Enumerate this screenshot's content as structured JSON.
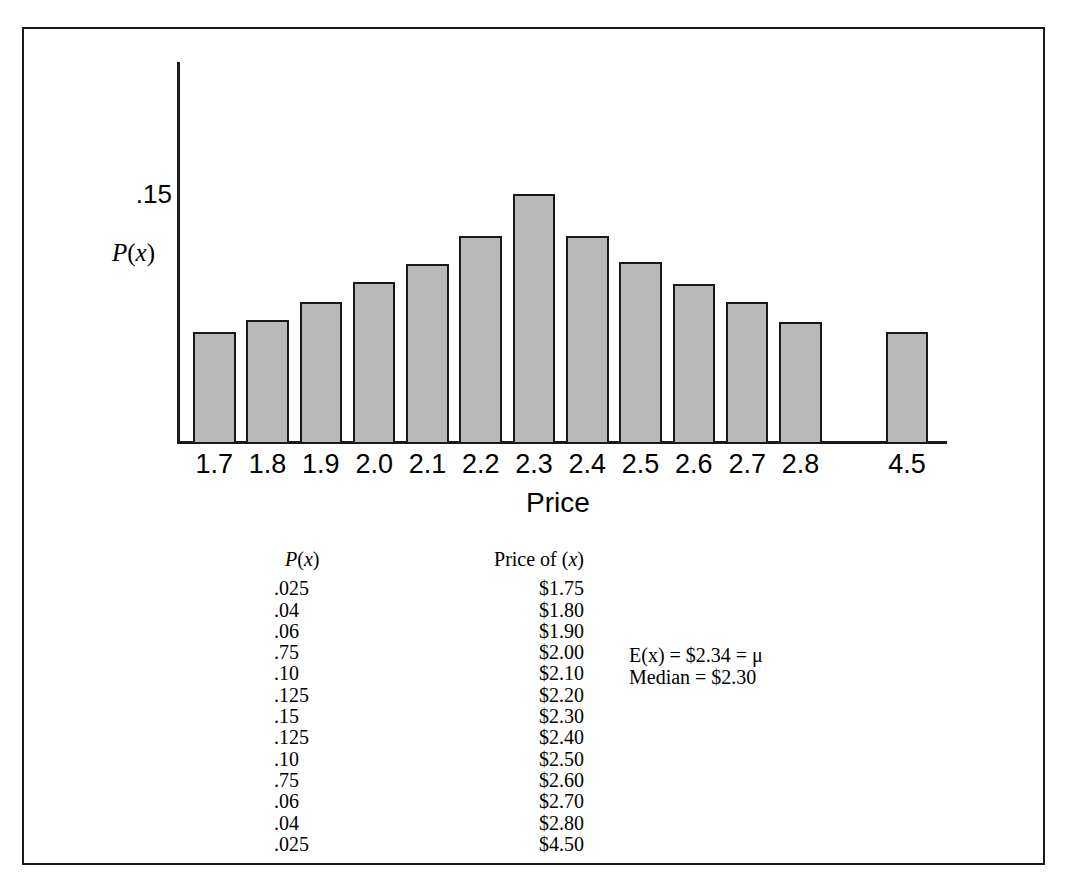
{
  "figure": {
    "frame_color": "#1a1a1a",
    "background": "#ffffff"
  },
  "chart_data": {
    "type": "bar",
    "title": "",
    "xlabel": "Price",
    "ylabel": "P(x)",
    "categories": [
      "1.7",
      "1.8",
      "1.9",
      "2.0",
      "2.1",
      "2.2",
      "2.3",
      "2.4",
      "2.5",
      "2.6",
      "2.7",
      "2.8",
      "",
      "4.5"
    ],
    "values": [
      0.025,
      0.04,
      0.06,
      0.075,
      0.1,
      0.125,
      0.15,
      0.125,
      0.1,
      0.075,
      0.06,
      0.04,
      null,
      0.025
    ],
    "bar_pixel_heights": [
      112,
      124,
      142,
      162,
      180,
      208,
      250,
      208,
      182,
      160,
      142,
      122,
      0,
      112
    ],
    "ytick_labels": [
      "0.15"
    ],
    "ytick_display": [
      ".15"
    ],
    "ylim": [
      0,
      0.19
    ],
    "grid": false,
    "legend": null,
    "bar_fill_color": "#b9b9b9",
    "bar_border_color": "#181818",
    "axis_color": "#1a1a1a",
    "gap_after_category": "2.8",
    "note": "Axis break between 2.8 and 4.5"
  },
  "axis": {
    "y_tick_value": ".15",
    "y_axis_title": "P(x)",
    "y_axis_title_italic_part": "P",
    "x_axis_title": "Price"
  },
  "table": {
    "header": {
      "probability": "P(x)",
      "price": "Price of (x)"
    },
    "rows": [
      {
        "probability": ".025",
        "price": "$1.75"
      },
      {
        "probability": ".04",
        "price": "$1.80"
      },
      {
        "probability": ".06",
        "price": "$1.90"
      },
      {
        "probability": ".75",
        "price": "$2.00"
      },
      {
        "probability": ".10",
        "price": "$2.10"
      },
      {
        "probability": ".125",
        "price": "$2.20"
      },
      {
        "probability": ".15",
        "price": "$2.30"
      },
      {
        "probability": ".125",
        "price": "$2.40"
      },
      {
        "probability": ".10",
        "price": "$2.50"
      },
      {
        "probability": ".75",
        "price": "$2.60"
      },
      {
        "probability": ".06",
        "price": "$2.70"
      },
      {
        "probability": ".04",
        "price": "$2.80"
      },
      {
        "probability": ".025",
        "price": "$4.50"
      }
    ]
  },
  "annotation": {
    "expected_value": "E(x) = $2.34 = μ",
    "median": "Median = $2.30"
  }
}
